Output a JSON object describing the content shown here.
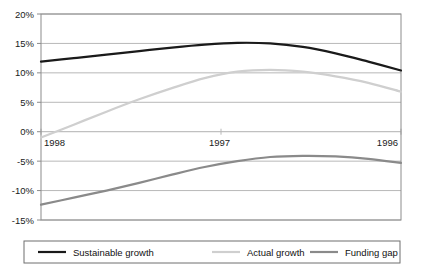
{
  "chart_data": {
    "type": "line",
    "title": "",
    "subtitle": "",
    "xlabel": "",
    "ylabel": "",
    "x": [
      "1998",
      "1997",
      "1996"
    ],
    "x_tick_labels": [
      "1998",
      "1997",
      "1996"
    ],
    "y_tick_labels": [
      "20%",
      "15%",
      "10%",
      "5%",
      "0%",
      "-5%",
      "-10%",
      "-15%"
    ],
    "y_tick_values": [
      20,
      15,
      10,
      5,
      0,
      -5,
      -10,
      -15
    ],
    "ylim": [
      -15,
      20
    ],
    "grid": "horizontal-gridlines-at-each-y-tick",
    "legend_position": "bottom",
    "series": [
      {
        "name": "Sustainable growth",
        "color": "#1a1a1a",
        "width": 2.2,
        "values": [
          11.9,
          15.1,
          10.4
        ],
        "points": [
          [
            0.0,
            11.9
          ],
          [
            0.1,
            12.5
          ],
          [
            0.2,
            13.1
          ],
          [
            0.3,
            13.7
          ],
          [
            0.4,
            14.3
          ],
          [
            0.5,
            14.8
          ],
          [
            0.6,
            15.1
          ],
          [
            0.7,
            15.0
          ],
          [
            0.8,
            14.4
          ],
          [
            0.9,
            13.3
          ],
          [
            1.0,
            11.9
          ],
          [
            1.1,
            10.4
          ]
        ]
      },
      {
        "name": "Actual growth",
        "color": "#cfcfcf",
        "width": 2.2,
        "values": [
          -1.0,
          10.5,
          6.8
        ],
        "points": [
          [
            0.0,
            -1.0
          ],
          [
            0.1,
            1.2
          ],
          [
            0.2,
            3.4
          ],
          [
            0.3,
            5.5
          ],
          [
            0.4,
            7.4
          ],
          [
            0.5,
            9.1
          ],
          [
            0.6,
            10.2
          ],
          [
            0.7,
            10.5
          ],
          [
            0.8,
            10.2
          ],
          [
            0.9,
            9.4
          ],
          [
            1.0,
            8.3
          ],
          [
            1.1,
            6.8
          ]
        ]
      },
      {
        "name": "Funding gap",
        "color": "#8a8a8a",
        "width": 2.2,
        "values": [
          -12.4,
          -4.1,
          -5.3
        ],
        "points": [
          [
            0.0,
            -12.4
          ],
          [
            0.1,
            -11.2
          ],
          [
            0.2,
            -10.0
          ],
          [
            0.3,
            -8.7
          ],
          [
            0.4,
            -7.3
          ],
          [
            0.5,
            -6.0
          ],
          [
            0.6,
            -5.0
          ],
          [
            0.7,
            -4.3
          ],
          [
            0.8,
            -4.1
          ],
          [
            0.9,
            -4.2
          ],
          [
            1.0,
            -4.6
          ],
          [
            1.1,
            -5.3
          ]
        ]
      }
    ]
  },
  "legend": {
    "items": [
      {
        "label": "Sustainable growth",
        "color": "#1a1a1a",
        "swatch_name": "legend-swatch-sustainable-growth"
      },
      {
        "label": "Actual growth",
        "color": "#cfcfcf",
        "swatch_name": "legend-swatch-actual-growth"
      },
      {
        "label": "Funding gap",
        "color": "#8a8a8a",
        "swatch_name": "legend-swatch-funding-gap"
      }
    ]
  },
  "colors": {
    "plot_border": "#8c8c8c",
    "gridline": "#b8b8b8",
    "zero_line": "#b0b0b0",
    "legend_border": "#6f6f6f",
    "background": "#ffffff",
    "text": "#1a1a1a"
  }
}
